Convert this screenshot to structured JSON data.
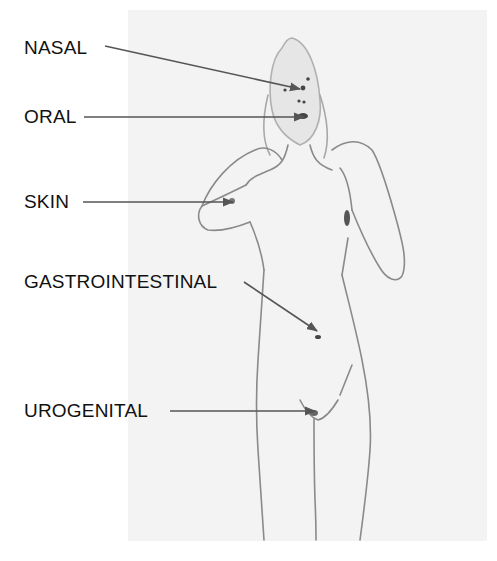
{
  "figure": {
    "labels": [
      {
        "id": "nasal",
        "text": "NASAL",
        "x": 24,
        "y": 38,
        "arrow": {
          "x1": 105,
          "y1": 46,
          "x2": 300,
          "y2": 89
        }
      },
      {
        "id": "oral",
        "text": "ORAL",
        "x": 24,
        "y": 107,
        "arrow": {
          "x1": 84,
          "y1": 117,
          "x2": 304,
          "y2": 117
        }
      },
      {
        "id": "skin",
        "text": "SKIN",
        "x": 24,
        "y": 192,
        "arrow": {
          "x1": 83,
          "y1": 202,
          "x2": 233,
          "y2": 202
        }
      },
      {
        "id": "gastrointestinal",
        "text": "GASTROINTESTINAL",
        "x": 24,
        "y": 272,
        "arrow": {
          "x1": 244,
          "y1": 282,
          "x2": 317,
          "y2": 331
        }
      },
      {
        "id": "urogenital",
        "text": "UROGENITAL",
        "x": 24,
        "y": 401,
        "arrow": {
          "x1": 170,
          "y1": 411,
          "x2": 315,
          "y2": 411
        }
      }
    ],
    "colors": {
      "label_text": "#111111",
      "arrow": "#555555",
      "photo_background": "#f3f3f3",
      "outline": "#8a8a8a",
      "hotspot": "#444444"
    }
  }
}
